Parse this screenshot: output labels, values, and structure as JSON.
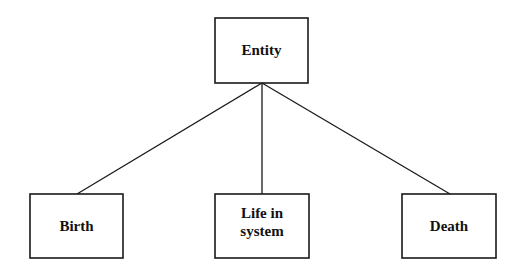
{
  "diagram": {
    "type": "tree",
    "root": {
      "id": "entity",
      "label": [
        "Entity"
      ]
    },
    "children": [
      {
        "id": "birth",
        "label": [
          "Birth"
        ]
      },
      {
        "id": "life-in-system",
        "label": [
          "Life in",
          "system"
        ]
      },
      {
        "id": "death",
        "label": [
          "Death"
        ]
      }
    ],
    "edges": [
      {
        "from": "entity",
        "to": "birth"
      },
      {
        "from": "entity",
        "to": "life-in-system"
      },
      {
        "from": "entity",
        "to": "death"
      }
    ],
    "colors": {
      "stroke": "#1a1a1a",
      "text": "#111111",
      "background": "#ffffff"
    }
  }
}
